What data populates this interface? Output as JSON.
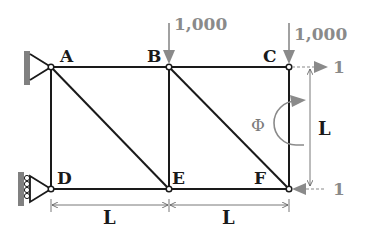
{
  "diagram": {
    "type": "truss",
    "nodes": [
      {
        "id": "A",
        "label": "A",
        "x": 51,
        "y": 67
      },
      {
        "id": "B",
        "label": "B",
        "x": 169,
        "y": 67
      },
      {
        "id": "C",
        "label": "C",
        "x": 289,
        "y": 67
      },
      {
        "id": "D",
        "label": "D",
        "x": 51,
        "y": 189
      },
      {
        "id": "E",
        "label": "E",
        "x": 169,
        "y": 189
      },
      {
        "id": "F",
        "label": "F",
        "x": 289,
        "y": 189
      }
    ],
    "members": [
      [
        "A",
        "B"
      ],
      [
        "B",
        "C"
      ],
      [
        "D",
        "E"
      ],
      [
        "E",
        "F"
      ],
      [
        "A",
        "D"
      ],
      [
        "B",
        "E"
      ],
      [
        "C",
        "F"
      ],
      [
        "A",
        "E"
      ],
      [
        "B",
        "F"
      ]
    ],
    "supports": [
      {
        "node": "A",
        "type": "pin"
      },
      {
        "node": "D",
        "type": "roller"
      }
    ],
    "loads": [
      {
        "node": "B",
        "direction": "down",
        "label": "1,000"
      },
      {
        "node": "C",
        "direction": "down",
        "label": "1,000"
      }
    ],
    "unit_loads": [
      {
        "node": "C",
        "direction": "right",
        "label": "1"
      },
      {
        "node": "F",
        "direction": "left",
        "label": "1"
      }
    ],
    "rotation": {
      "label": "Φ"
    },
    "dimensions": {
      "horizontal_1": "L",
      "horizontal_2": "L",
      "vertical": "L"
    },
    "colors": {
      "member": "#1a1a1a",
      "load": "#8a8a8a",
      "support": "#808080"
    }
  }
}
